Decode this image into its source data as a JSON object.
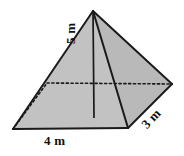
{
  "figure": {
    "name": "rectangular-pyramid-diagram",
    "shape": "rectangular pyramid",
    "background_color": "#ffffff",
    "outline_color": "#1a1a1a",
    "face_fill_front_left": "#c2c2c2",
    "face_fill_front_right": "#b9b9b9",
    "face_fill_back_highlight": "#e2e2e2",
    "base_fill": "#c8c8c8",
    "labels": {
      "height": "5 m",
      "base_width": "4 m",
      "base_depth": "3 m"
    },
    "geometry": {
      "apex": [
        93,
        11
      ],
      "base_front_left": [
        13,
        129
      ],
      "base_front_right": [
        128,
        128
      ],
      "base_right": [
        172,
        84
      ],
      "base_back_hidden": [
        47,
        83
      ],
      "height_foot": [
        94,
        118
      ]
    }
  }
}
